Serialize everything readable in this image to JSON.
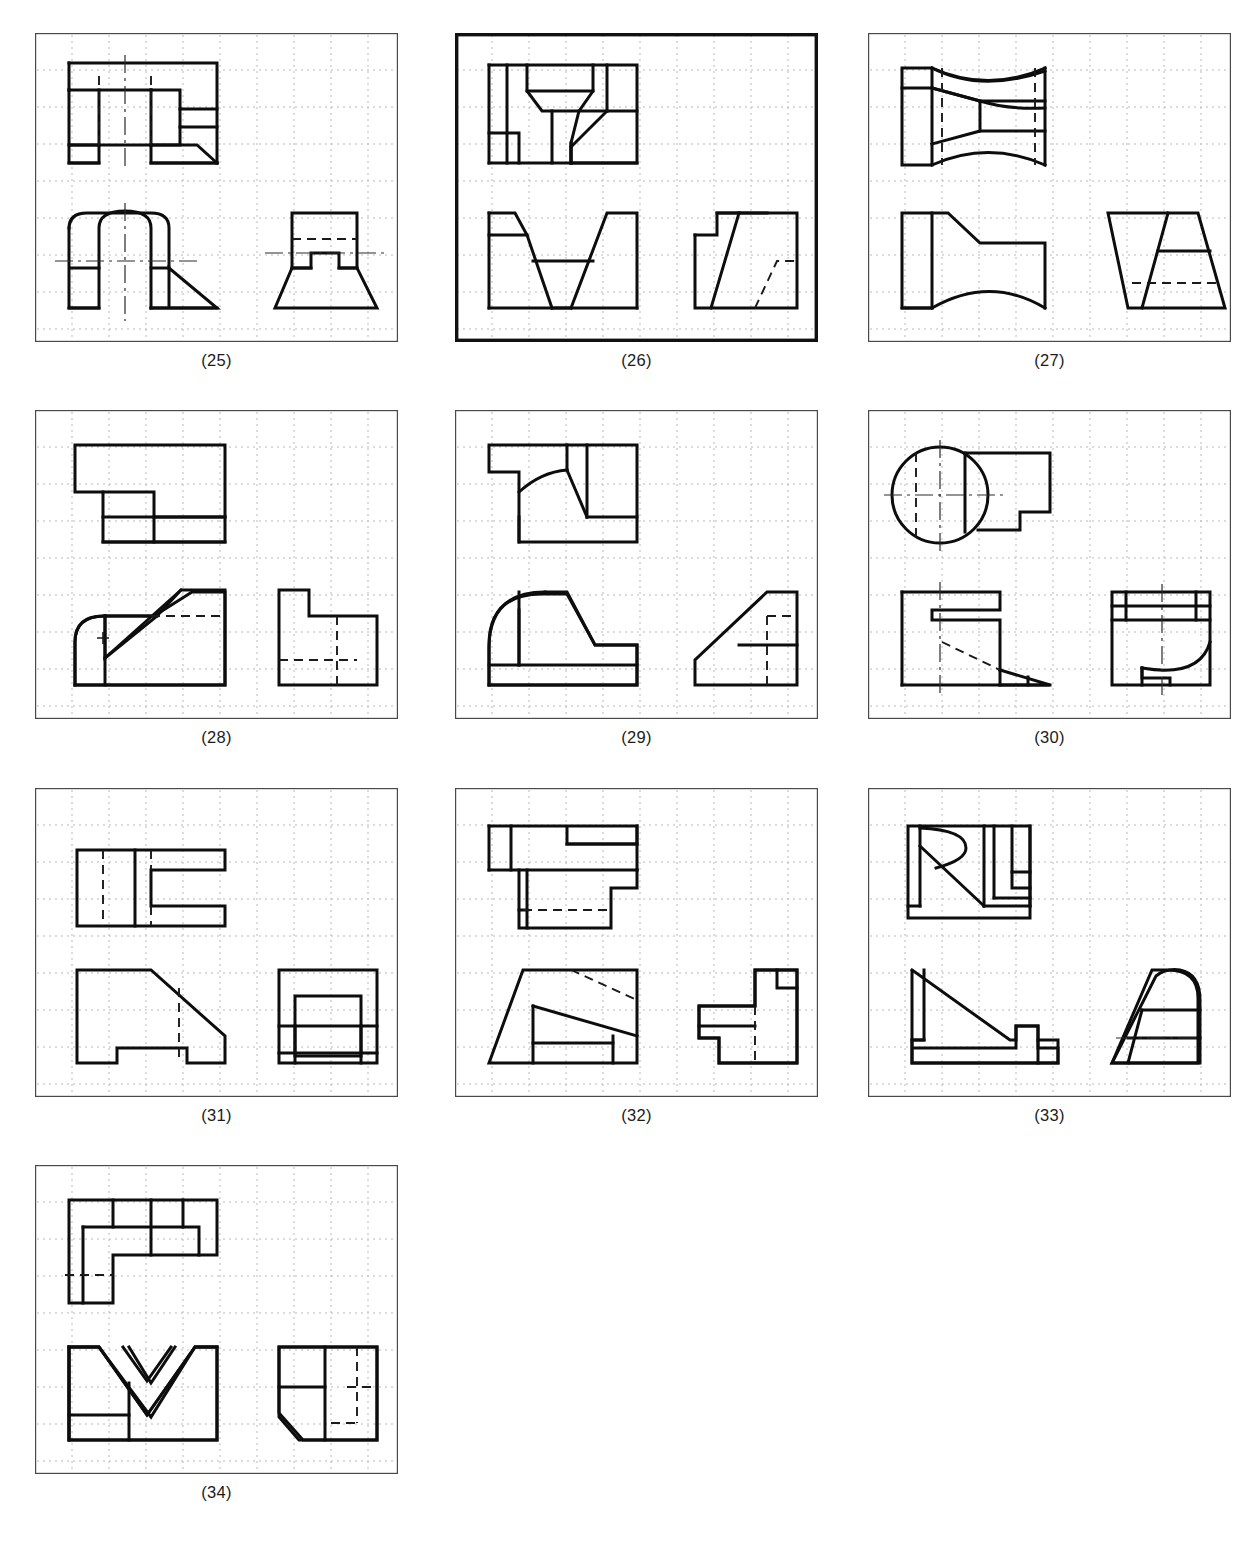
{
  "sheet": {
    "width": 1253,
    "height": 1541,
    "background": "#ffffff",
    "ink_color": "#0d0d0d",
    "grid_color": "#b9b9b9",
    "frame_color": "#4a4a4a"
  },
  "layout": {
    "columns": 3,
    "rows": 4,
    "panel_width": 363,
    "panel_height": 309,
    "col_x": [
      35,
      455,
      868
    ],
    "row_y": [
      33,
      410,
      788,
      1165
    ],
    "caption_offset_y": 318
  },
  "grid": {
    "pitch_px": 37,
    "style": "dotted",
    "description": "light dotted square grid inside each panel frame"
  },
  "panels": [
    {
      "id": "p25",
      "caption": "(25)",
      "frame": "thin",
      "views": [
        "top",
        "front",
        "right-side"
      ],
      "notes": "Top view: stepped rectangular block with hidden lines; front view: arch/rounded slot with inclined cut; side view: T-shaped block on trapezoidal base"
    },
    {
      "id": "p26",
      "caption": "(26)",
      "frame": "thick",
      "views": [
        "top",
        "front",
        "right-side"
      ],
      "notes": "Top view: notched plate with funnel/V shape; front view: V-groove block; side view: inclined slot with hidden line"
    },
    {
      "id": "p27",
      "caption": "(27)",
      "frame": "thin",
      "views": [
        "top",
        "front",
        "right-side"
      ],
      "notes": "Top view: hourglass/tapered body with flange; front view: concave curved taper; side view: trapezoid with hidden line"
    },
    {
      "id": "p28",
      "caption": "(28)",
      "frame": "thin",
      "views": [
        "top",
        "front",
        "right-side"
      ],
      "notes": "Top view: L-stepped plate; front view: rounded corner with inclined face and center cross; side view: notched block with hidden lines"
    },
    {
      "id": "p29",
      "caption": "(29)",
      "frame": "thin",
      "views": [
        "top",
        "front",
        "right-side"
      ],
      "notes": "Top view: block with fillet arc and notch; front view: large radius corner with inclined face and base slab; side view: inclined wedge with hidden line"
    },
    {
      "id": "p30",
      "caption": "(30)",
      "frame": "thin",
      "views": [
        "top",
        "front",
        "right-side"
      ],
      "notes": "Top view: full circle with centerlines joined to stepped tab; front view: block with slot and inclined hidden line; side view: cylinder with internal arc cut"
    },
    {
      "id": "p31",
      "caption": "(31)",
      "frame": "thin",
      "views": [
        "top",
        "front",
        "right-side"
      ],
      "notes": "Top view: C-shaped slotted plate with hidden line; front view: chamfered block with bottom notch; side view: nested rectangles"
    },
    {
      "id": "p32",
      "caption": "(32)",
      "frame": "thin",
      "views": [
        "top",
        "front",
        "right-side"
      ],
      "notes": "Top view: stepped plate with hidden line; front view: inclined prism with hidden edge; side view: stepped profile with hidden line"
    },
    {
      "id": "p33",
      "caption": "(33)",
      "frame": "thin",
      "views": [
        "top",
        "front",
        "right-side"
      ],
      "notes": "Top view: block with long diagonal and tangent arc; front view: ramp with rib and notch; side view: dome-topped wedge with horizontal bands"
    },
    {
      "id": "p34",
      "caption": "(34)",
      "frame": "thin",
      "views": [
        "top",
        "front",
        "right-side"
      ],
      "notes": "Top view: L-shaped plate with partitions and hidden line; front view: V-notch block; side view: chamfered block with hidden lines"
    }
  ]
}
